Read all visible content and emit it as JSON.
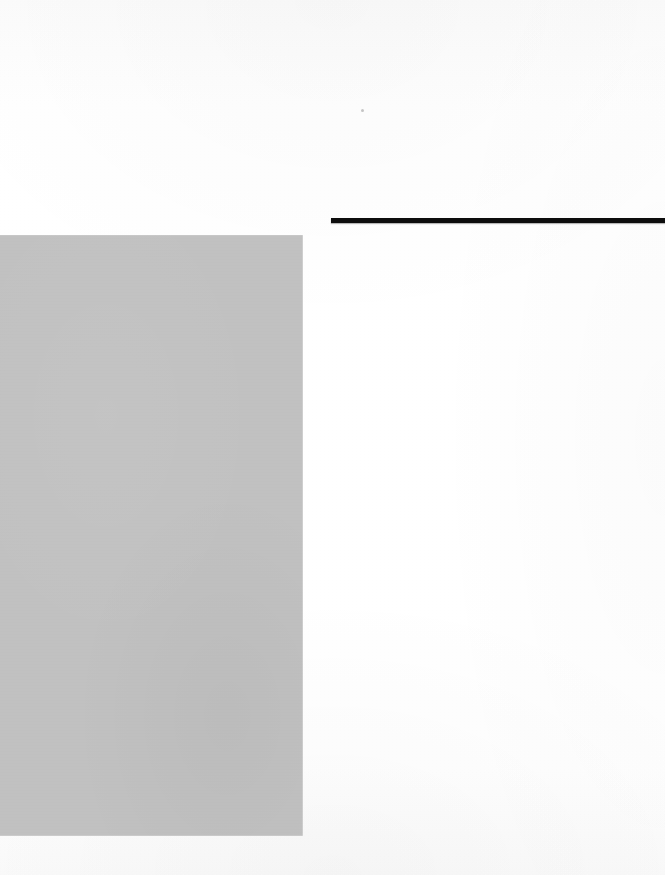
{
  "page": {
    "kind": "scanned-book-page",
    "width": 665,
    "height": 875,
    "background_color": "#fdfdfd",
    "visible_text": "",
    "note": "Blank section-opening page: no legible text rendered in the pixels."
  },
  "header_rule": {
    "name": "horizontal-rule",
    "color": "#0d0d0d",
    "x": 331,
    "y": 218,
    "width": 334,
    "height": 5
  },
  "image_block": {
    "name": "photo-placeholder",
    "color": "#c1c1c1",
    "x": 0,
    "y": 235,
    "width": 303,
    "height": 601,
    "caption": ""
  },
  "artifact": {
    "name": "scan-speck",
    "color": "#787878",
    "x": 361,
    "y": 109
  },
  "regions": {
    "top_margin_label": "",
    "right_column_label": "",
    "bottom_margin_label": ""
  }
}
